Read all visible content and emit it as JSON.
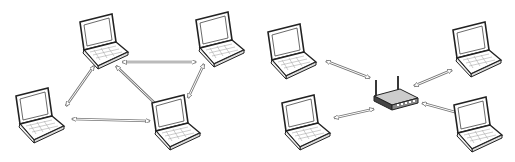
{
  "diagram": {
    "panels": [
      {
        "name": "ad-hoc-network",
        "nodes": [
          {
            "id": "laptop-top-left",
            "icon": "laptop-icon",
            "x": 78,
            "y": 14
          },
          {
            "id": "laptop-top-right",
            "icon": "laptop-icon",
            "x": 193,
            "y": 12
          },
          {
            "id": "laptop-bottom-left",
            "icon": "laptop-icon",
            "x": 12,
            "y": 88
          },
          {
            "id": "laptop-bottom-right",
            "icon": "laptop-icon",
            "x": 148,
            "y": 95
          }
        ],
        "links": [
          [
            "laptop-top-left",
            "laptop-top-right"
          ],
          [
            "laptop-top-left",
            "laptop-bottom-left"
          ],
          [
            "laptop-top-left",
            "laptop-bottom-right"
          ],
          [
            "laptop-top-right",
            "laptop-bottom-right"
          ],
          [
            "laptop-bottom-left",
            "laptop-bottom-right"
          ]
        ]
      },
      {
        "name": "infrastructure-network",
        "center": {
          "id": "wireless-router",
          "icon": "router-icon"
        },
        "nodes": [
          {
            "id": "laptop-upper-left",
            "icon": "laptop-icon"
          },
          {
            "id": "laptop-lower-left",
            "icon": "laptop-icon"
          },
          {
            "id": "laptop-upper-right",
            "icon": "laptop-icon"
          },
          {
            "id": "laptop-lower-right",
            "icon": "laptop-icon"
          }
        ]
      }
    ],
    "colors": {
      "stroke": "#222222",
      "arrow": "#666666",
      "fill": "#ffffff",
      "router": "#333333"
    }
  }
}
